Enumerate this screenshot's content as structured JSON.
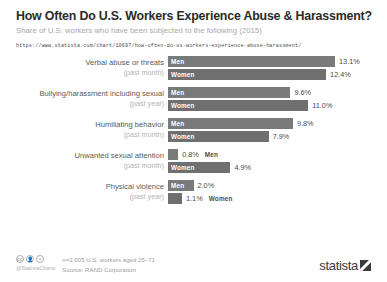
{
  "header": {
    "title": "How Often Do U.S. Workers Experience Abuse & Harassment?",
    "subtitle": "Share of U.S. workers who have been subjected to the following (2015)",
    "url": "https://www.statista.com/chart/10697/how-often-do-us-workers-experience-abuse-harassment/"
  },
  "footer": {
    "cc_icons": [
      "cc-icon",
      "by-icon",
      "nd-icon"
    ],
    "handle": "@StatistaCharts",
    "note_sample": "n=2,005 U.S. workers aged 25–71",
    "note_source": "Source: RAND Corporation",
    "brand": "statista"
  },
  "colors": {
    "bar_men": "#7a7a7a",
    "bar_women": "#6f6f6f",
    "title": "#2b2b2b",
    "subtitle": "#a9a9a9",
    "value_text": "#4c4c4c"
  },
  "chart_data": {
    "type": "bar",
    "title": "How Often Do U.S. Workers Experience Abuse & Harassment?",
    "subtitle": "Share of U.S. workers who have been subjected to the following (2015)",
    "xlabel": "",
    "ylabel": "",
    "xlim": [
      0,
      14
    ],
    "unit": "%",
    "grid": false,
    "legend": "in-bar labels",
    "orientation": "horizontal",
    "categories": [
      "Verbal abuse or threats",
      "Bullying/harassment including sexual",
      "Humiliating behavior",
      "Unwanted sexual attention",
      "Physical violence"
    ],
    "category_periods": [
      "(past month)",
      "(past year)",
      "(past month)",
      "(past month)",
      "(past year)"
    ],
    "series": [
      {
        "name": "Men",
        "values": [
          13.1,
          9.6,
          9.8,
          0.8,
          2.0
        ]
      },
      {
        "name": "Women",
        "values": [
          12.4,
          11.0,
          7.9,
          4.9,
          1.1
        ]
      }
    ],
    "groups": [
      {
        "category": "Verbal abuse or threats",
        "period": "(past month)",
        "bars": [
          {
            "series": "Men",
            "value": 13.1,
            "value_label": "13.1%",
            "label_inside": true
          },
          {
            "series": "Women",
            "value": 12.4,
            "value_label": "12.4%",
            "label_inside": true
          }
        ]
      },
      {
        "category": "Bullying/harassment including sexual",
        "period": "(past year)",
        "bars": [
          {
            "series": "Men",
            "value": 9.6,
            "value_label": "9.6%",
            "label_inside": true
          },
          {
            "series": "Women",
            "value": 11.0,
            "value_label": "11.0%",
            "label_inside": true
          }
        ]
      },
      {
        "category": "Humiliating behavior",
        "period": "(past month)",
        "bars": [
          {
            "series": "Men",
            "value": 9.8,
            "value_label": "9.8%",
            "label_inside": true
          },
          {
            "series": "Women",
            "value": 7.9,
            "value_label": "7.9%",
            "label_inside": true
          }
        ]
      },
      {
        "category": "Unwanted sexual attention",
        "period": "(past month)",
        "bars": [
          {
            "series": "Men",
            "value": 0.8,
            "value_label": "0.8%",
            "label_inside": false
          },
          {
            "series": "Women",
            "value": 4.9,
            "value_label": "4.9%",
            "label_inside": true
          }
        ]
      },
      {
        "category": "Physical violence",
        "period": "(past year)",
        "bars": [
          {
            "series": "Men",
            "value": 2.0,
            "value_label": "2.0%",
            "label_inside": true
          },
          {
            "series": "Women",
            "value": 1.1,
            "value_label": "1.1%",
            "label_inside": false
          }
        ]
      }
    ],
    "source": "RAND Corporation",
    "sample": "n=2,005 U.S. workers aged 25–71"
  }
}
